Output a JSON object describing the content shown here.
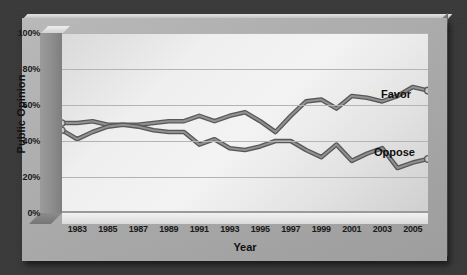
{
  "chart_data": {
    "type": "line",
    "title": "",
    "xlabel": "Year",
    "ylabel": "Public Opinion",
    "xlim": [
      1982,
      2006
    ],
    "ylim": [
      0,
      100
    ],
    "grid": true,
    "legend": "inline-end-labels",
    "x_tick_labels": [
      "1983",
      "1985",
      "1987",
      "1989",
      "1991",
      "1993",
      "1995",
      "1997",
      "1999",
      "2001",
      "2003",
      "2005"
    ],
    "y_tick_labels": [
      "0%",
      "20%",
      "40%",
      "60%",
      "80%",
      "100%"
    ],
    "x": [
      1982,
      1983,
      1984,
      1985,
      1986,
      1987,
      1988,
      1989,
      1990,
      1991,
      1992,
      1993,
      1994,
      1995,
      1996,
      1997,
      1998,
      1999,
      2000,
      2001,
      2002,
      2003,
      2004,
      2005
    ],
    "series": [
      {
        "name": "Favor",
        "color": "#6e6e6e",
        "marker_end": true,
        "values": [
          50,
          50,
          51,
          49,
          49,
          49,
          50,
          51,
          51,
          54,
          51,
          54,
          56,
          51,
          45,
          54,
          62,
          63,
          58,
          65,
          64,
          62,
          65,
          70
        ]
      },
      {
        "name": "Oppose",
        "color": "#6e6e6e",
        "marker_end": true,
        "values": [
          46,
          41,
          45,
          48,
          49,
          48,
          46,
          45,
          45,
          38,
          41,
          36,
          35,
          37,
          40,
          40,
          35,
          31,
          38,
          29,
          33,
          36,
          25,
          28
        ]
      }
    ],
    "endpoints": [
      {
        "series": "Favor",
        "x": 2006,
        "y": 68
      },
      {
        "series": "Oppose",
        "x": 2006,
        "y": 30
      }
    ]
  },
  "axes": {
    "y_title": "Public Opinion",
    "x_title": "Year",
    "y_ticks": [
      "100%",
      "80%",
      "60%",
      "40%",
      "20%",
      "0%"
    ],
    "x_ticks": [
      "1983",
      "1985",
      "1987",
      "1989",
      "1991",
      "1993",
      "1995",
      "1997",
      "1999",
      "2001",
      "2003",
      "2005"
    ]
  },
  "labels": {
    "favor": "Favor",
    "oppose": "Oppose"
  },
  "colors": {
    "background": "#3a3a3a",
    "slab": "#ababab",
    "plot_panel": "#ededed",
    "gridline": "#b4b4b4",
    "line": "#6e6e6e",
    "text": "#111111"
  }
}
